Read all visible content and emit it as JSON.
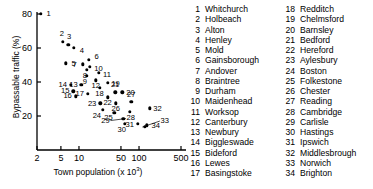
{
  "chart_data": {
    "type": "scatter",
    "title": "",
    "xlabel": "Town population (x 10³)",
    "xlabel_base": "Town population (x 10",
    "xlabel_sup": "3",
    "xlabel_tail": ")",
    "ylabel": "Bypassable traffic (%)",
    "xscale": "log",
    "xlim": [
      2,
      500
    ],
    "ylim": [
      10,
      82
    ],
    "xticks": [
      2,
      5,
      10,
      50,
      100,
      500
    ],
    "xtick_labels": [
      "2",
      "5",
      "10",
      "50",
      "100",
      "500"
    ],
    "yticks": [
      20,
      40,
      60,
      80
    ],
    "ytick_labels": [
      "20",
      "40",
      "60",
      "80"
    ],
    "grid": false,
    "legend_position": "right",
    "marker": "filled-circle",
    "marker_color": "#000000",
    "points": [
      {
        "id": 1,
        "name": "Whitchurch",
        "x": 2.3,
        "y": 80.0,
        "lx": 8,
        "ly": 0
      },
      {
        "id": 2,
        "name": "Holbeach",
        "x": 5.4,
        "y": 63.5,
        "lx": -1,
        "ly": -8
      },
      {
        "id": 3,
        "name": "Alton",
        "x": 6.6,
        "y": 62.0,
        "lx": 1,
        "ly": -8
      },
      {
        "id": 4,
        "name": "Henley",
        "x": 8.2,
        "y": 60.0,
        "lx": 8,
        "ly": 3
      },
      {
        "id": 5,
        "name": "Mold",
        "x": 6.0,
        "y": 51.0,
        "lx": 8,
        "ly": 1
      },
      {
        "id": 6,
        "name": "Gainsborough",
        "x": 14.5,
        "y": 53.0,
        "lx": 8,
        "ly": -3
      },
      {
        "id": 7,
        "name": "Andover",
        "x": 11.5,
        "y": 50.5,
        "lx": -8,
        "ly": 1
      },
      {
        "id": 8,
        "name": "Braintree",
        "x": 13.5,
        "y": 47.0,
        "lx": -2,
        "ly": 6
      },
      {
        "id": 9,
        "name": "Durham",
        "x": 13.5,
        "y": 43.5,
        "lx": -2,
        "ly": 6
      },
      {
        "id": 10,
        "name": "Maidenhead",
        "x": 15.0,
        "y": 49.0,
        "lx": 9,
        "ly": 2
      },
      {
        "id": 11,
        "name": "Worksop",
        "x": 21.5,
        "y": 45.5,
        "lx": 8,
        "ly": 2
      },
      {
        "id": 12,
        "name": "Canterbury",
        "x": 19.0,
        "y": 41.0,
        "lx": 0,
        "ly": 6
      },
      {
        "id": 13,
        "name": "Newbury",
        "x": 11.0,
        "y": 38.5,
        "lx": -8,
        "ly": 0
      },
      {
        "id": 14,
        "name": "Biggleswade",
        "x": 7.3,
        "y": 38.5,
        "lx": -8,
        "ly": 0
      },
      {
        "id": 15,
        "name": "Bideford",
        "x": 8.0,
        "y": 34.5,
        "lx": -8,
        "ly": 0
      },
      {
        "id": 16,
        "name": "Lewes",
        "x": 8.8,
        "y": 31.5,
        "lx": -8,
        "ly": 0
      },
      {
        "id": 17,
        "name": "Basingstoke",
        "x": 14.0,
        "y": 33.0,
        "lx": -8,
        "ly": 0
      },
      {
        "id": 18,
        "name": "Redditch",
        "x": 22.0,
        "y": 36.5,
        "lx": 0,
        "ly": 6
      },
      {
        "id": 19,
        "name": "Chelmsford",
        "x": 30.0,
        "y": 39.5,
        "lx": 8,
        "ly": 1
      },
      {
        "id": 20,
        "name": "Barnsley",
        "x": 53.0,
        "y": 34.0,
        "lx": 8,
        "ly": 1
      },
      {
        "id": 21,
        "name": "Bedford",
        "x": 40.0,
        "y": 34.0,
        "lx": 0,
        "ly": -7
      },
      {
        "id": 22,
        "name": "Hereford",
        "x": 30.0,
        "y": 31.0,
        "lx": 0,
        "ly": 6
      },
      {
        "id": 23,
        "name": "Aylesbury",
        "x": 22.5,
        "y": 27.5,
        "lx": -8,
        "ly": 1
      },
      {
        "id": 24,
        "name": "Boston",
        "x": 25.0,
        "y": 23.5,
        "lx": -6,
        "ly": 6
      },
      {
        "id": 25,
        "name": "Folkestone",
        "x": 39.0,
        "y": 22.0,
        "lx": -6,
        "ly": 5
      },
      {
        "id": 26,
        "name": "Chester",
        "x": 41.0,
        "y": 27.5,
        "lx": 0,
        "ly": 6
      },
      {
        "id": 27,
        "name": "Reading",
        "x": 74.0,
        "y": 28.5,
        "lx": 0,
        "ly": -7
      },
      {
        "id": 28,
        "name": "Cambridge",
        "x": 70.0,
        "y": 22.5,
        "lx": 1,
        "ly": 6
      },
      {
        "id": 29,
        "name": "Carlisle",
        "x": 55.0,
        "y": 18.5,
        "lx": -18,
        "ly": 2,
        "leader": true
      },
      {
        "id": 30,
        "name": "Hastings",
        "x": 58.0,
        "y": 15.5,
        "lx": -3,
        "ly": 6
      },
      {
        "id": 31,
        "name": "Ipswich",
        "x": 95.0,
        "y": 15.5,
        "lx": -8,
        "ly": 1
      },
      {
        "id": 32,
        "name": "Middlesbrough",
        "x": 150.0,
        "y": 24.5,
        "lx": 8,
        "ly": 1
      },
      {
        "id": 33,
        "name": "Norwich",
        "x": 125.0,
        "y": 13.5,
        "lx": 20,
        "ly": -6,
        "leader": true
      },
      {
        "id": 34,
        "name": "Brighton",
        "x": 135.0,
        "y": 14.5,
        "lx": 9,
        "ly": 1
      }
    ]
  },
  "legend": {
    "column1": [
      {
        "num": "1",
        "name": "Whitchurch"
      },
      {
        "num": "2",
        "name": "Holbeach"
      },
      {
        "num": "3",
        "name": "Alton"
      },
      {
        "num": "4",
        "name": "Henley"
      },
      {
        "num": "5",
        "name": "Mold"
      },
      {
        "num": "6",
        "name": "Gainsborough"
      },
      {
        "num": "7",
        "name": "Andover"
      },
      {
        "num": "8",
        "name": "Braintree"
      },
      {
        "num": "9",
        "name": "Durham"
      },
      {
        "num": "10",
        "name": "Maidenhead"
      },
      {
        "num": "11",
        "name": "Worksop"
      },
      {
        "num": "12",
        "name": "Canterbury"
      },
      {
        "num": "13",
        "name": "Newbury"
      },
      {
        "num": "14",
        "name": "Biggleswade"
      },
      {
        "num": "15",
        "name": "Bideford"
      },
      {
        "num": "16",
        "name": "Lewes"
      },
      {
        "num": "17",
        "name": "Basingstoke"
      }
    ],
    "column2": [
      {
        "num": "18",
        "name": "Redditch"
      },
      {
        "num": "19",
        "name": "Chelmsford"
      },
      {
        "num": "20",
        "name": "Barnsley"
      },
      {
        "num": "21",
        "name": "Bedford"
      },
      {
        "num": "22",
        "name": "Hereford"
      },
      {
        "num": "23",
        "name": "Aylesbury"
      },
      {
        "num": "24",
        "name": "Boston"
      },
      {
        "num": "25",
        "name": "Folkestone"
      },
      {
        "num": "26",
        "name": "Chester"
      },
      {
        "num": "27",
        "name": "Reading"
      },
      {
        "num": "28",
        "name": "Cambridge"
      },
      {
        "num": "29",
        "name": "Carlisle"
      },
      {
        "num": "30",
        "name": "Hastings"
      },
      {
        "num": "31",
        "name": "Ipswich"
      },
      {
        "num": "32",
        "name": "Middlesbrough"
      },
      {
        "num": "33",
        "name": "Norwich"
      },
      {
        "num": "34",
        "name": "Brighton"
      }
    ]
  }
}
